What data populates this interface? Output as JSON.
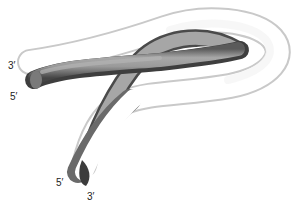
{
  "figure": {
    "strands": [
      {
        "name": "white-strand",
        "color": "#ffffff",
        "shade": "#bdbdbd"
      },
      {
        "name": "grey-strand",
        "color": "#9a9a9a",
        "shade": "#4a4a4a"
      }
    ],
    "labels": {
      "top_upper": "3′",
      "top_lower": "5′",
      "bottom_left": "5′",
      "bottom_right": "3′"
    }
  }
}
